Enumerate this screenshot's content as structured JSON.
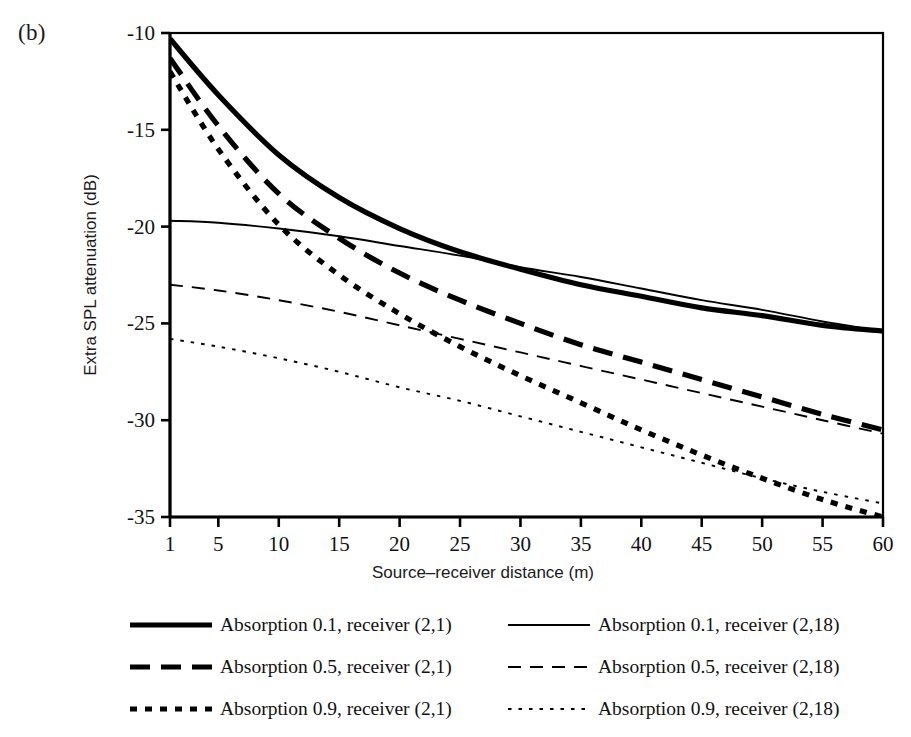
{
  "panel": {
    "label": "(b)"
  },
  "chart_data": {
    "type": "line",
    "title": "",
    "xlabel": "Source–receiver distance (m)",
    "ylabel": "Extra SPL attenuation (dB)",
    "xlim": [
      1,
      60
    ],
    "ylim": [
      -35,
      -10
    ],
    "xticks": [
      1,
      5,
      10,
      15,
      20,
      25,
      30,
      35,
      40,
      45,
      50,
      55,
      60
    ],
    "xtick_labels": [
      "1",
      "5",
      "10",
      "15",
      "20",
      "25",
      "30",
      "35",
      "40",
      "45",
      "50",
      "55",
      "60"
    ],
    "yticks": [
      -10,
      -15,
      -20,
      -25,
      -30,
      -35
    ],
    "ytick_labels": [
      "-10",
      "-15",
      "-20",
      "-25",
      "-30",
      "-35"
    ],
    "grid": false,
    "legend_position": "below",
    "x": [
      1,
      5,
      10,
      15,
      20,
      25,
      30,
      35,
      40,
      45,
      50,
      55,
      60
    ],
    "series": [
      {
        "name": "Absorption 0.1, receiver (2,1)",
        "style": "solid",
        "width": "thick",
        "color": "#000000",
        "values": [
          -10.3,
          -13.2,
          -16.3,
          -18.5,
          -20.1,
          -21.3,
          -22.2,
          -23.0,
          -23.6,
          -24.2,
          -24.6,
          -25.1,
          -25.4
        ]
      },
      {
        "name": "Absorption 0.5, receiver (2,1)",
        "style": "dashed",
        "width": "thick",
        "color": "#000000",
        "values": [
          -11.3,
          -14.8,
          -18.3,
          -20.6,
          -22.4,
          -23.8,
          -25.0,
          -26.1,
          -27.0,
          -27.9,
          -28.8,
          -29.7,
          -30.5
        ]
      },
      {
        "name": "Absorption 0.9, receiver (2,1)",
        "style": "dotted",
        "width": "thick",
        "color": "#000000",
        "values": [
          -12.0,
          -16.0,
          -19.9,
          -22.5,
          -24.5,
          -26.2,
          -27.7,
          -29.1,
          -30.5,
          -31.8,
          -33.0,
          -34.1,
          -35.0
        ]
      },
      {
        "name": "Absorption 0.1, receiver (2,18)",
        "style": "solid",
        "width": "thin",
        "color": "#000000",
        "values": [
          -19.7,
          -19.8,
          -20.1,
          -20.5,
          -21.0,
          -21.5,
          -22.1,
          -22.6,
          -23.2,
          -23.8,
          -24.3,
          -24.9,
          -25.4
        ]
      },
      {
        "name": "Absorption 0.5, receiver (2,18)",
        "style": "dashed",
        "width": "thin",
        "color": "#000000",
        "values": [
          -23.0,
          -23.3,
          -23.8,
          -24.4,
          -25.1,
          -25.8,
          -26.5,
          -27.2,
          -27.9,
          -28.6,
          -29.3,
          -30.0,
          -30.7
        ]
      },
      {
        "name": "Absorption 0.9, receiver (2,18)",
        "style": "dotted",
        "width": "thin",
        "color": "#000000",
        "values": [
          -25.8,
          -26.2,
          -26.8,
          -27.5,
          -28.3,
          -29.0,
          -29.8,
          -30.6,
          -31.4,
          -32.2,
          -33.0,
          -33.7,
          -34.3
        ]
      }
    ]
  },
  "legend": {
    "left_column": [
      {
        "label": "Absorption 0.1, receiver (2,1)",
        "style": "solid",
        "width": "thick"
      },
      {
        "label": "Absorption 0.5, receiver (2,1)",
        "style": "dashed",
        "width": "thick"
      },
      {
        "label": "Absorption 0.9, receiver (2,1)",
        "style": "dotted",
        "width": "thick"
      }
    ],
    "right_column": [
      {
        "label": "Absorption 0.1, receiver (2,18)",
        "style": "solid",
        "width": "thin"
      },
      {
        "label": "Absorption 0.5, receiver (2,18)",
        "style": "dashed",
        "width": "thin"
      },
      {
        "label": "Absorption 0.9, receiver (2,18)",
        "style": "dotted",
        "width": "thin"
      }
    ]
  }
}
